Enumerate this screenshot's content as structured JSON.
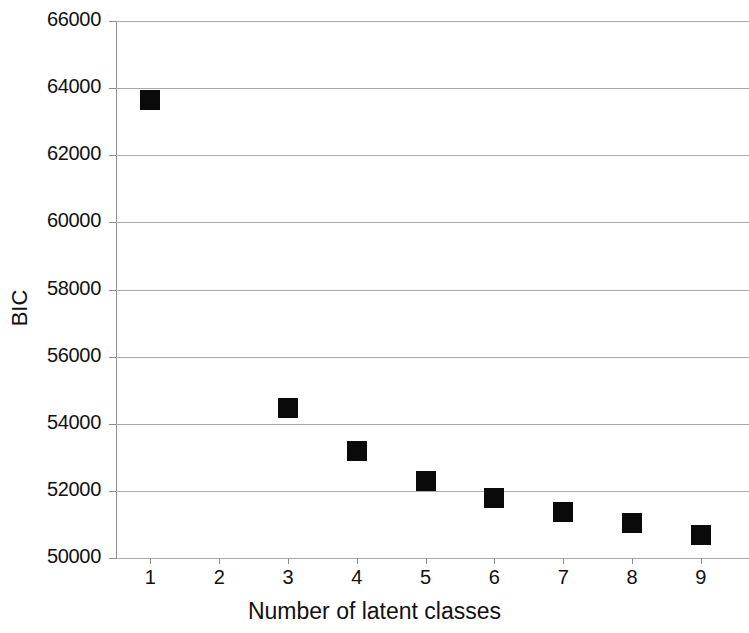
{
  "chart_data": {
    "type": "scatter",
    "title": "",
    "xlabel": "Number of latent classes",
    "ylabel": "BIC",
    "xlim": [
      0.5,
      9.7
    ],
    "ylim": [
      50000,
      66000
    ],
    "grid": true,
    "legend": null,
    "marker_style": "filled-square",
    "marker_color": "#0a0a0a",
    "x_ticks": [
      1,
      2,
      3,
      4,
      5,
      6,
      7,
      8,
      9
    ],
    "x_tick_labels": [
      "1",
      "2",
      "3",
      "4",
      "5",
      "6",
      "7",
      "8",
      "9"
    ],
    "y_ticks": [
      50000,
      52000,
      54000,
      56000,
      58000,
      60000,
      62000,
      64000,
      66000
    ],
    "y_tick_labels": [
      "50000",
      "52000",
      "54000",
      "56000",
      "58000",
      "60000",
      "62000",
      "64000",
      "66000"
    ],
    "series": [
      {
        "name": "BIC",
        "points": [
          {
            "x": 1,
            "y": 63650
          },
          {
            "x": 3,
            "y": 54470
          },
          {
            "x": 4,
            "y": 53180
          },
          {
            "x": 5,
            "y": 52300
          },
          {
            "x": 6,
            "y": 51790
          },
          {
            "x": 7,
            "y": 51370
          },
          {
            "x": 8,
            "y": 51030
          },
          {
            "x": 9,
            "y": 50700
          }
        ]
      }
    ]
  }
}
